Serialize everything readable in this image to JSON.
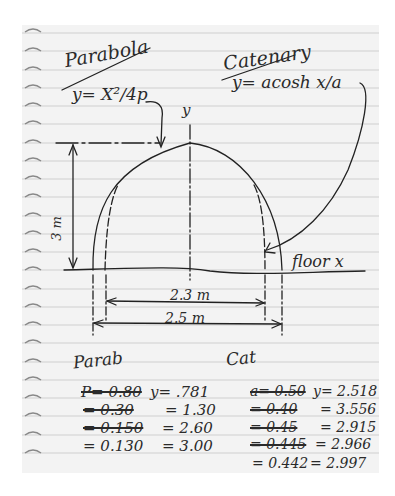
{
  "note": {
    "title_parabola": "Parabola",
    "eq_parabola": "y= X²/4p",
    "title_catenary": "Catenary",
    "eq_catenary": "y= acosh x/a",
    "axis_y": "y",
    "axis_floor": "floor x",
    "height_label": "3 m",
    "inner_width": "2.3 m",
    "outer_width": "2.5 m"
  },
  "parab": {
    "heading": "Parab",
    "rows": [
      {
        "p": "P= 0.80",
        "p_struck": true,
        "y": "y= .781"
      },
      {
        "p": "= 0.30",
        "p_struck": true,
        "y": "= 1.30"
      },
      {
        "p": "= 0.150",
        "p_struck": true,
        "y": "= 2.60"
      },
      {
        "p": "= 0.130",
        "p_struck": false,
        "y": "= 3.00"
      }
    ]
  },
  "cat": {
    "heading": "Cat",
    "rows": [
      {
        "a": "a= 0.50",
        "a_struck": true,
        "y": "y= 2.518"
      },
      {
        "a": "= 0.40",
        "a_struck": true,
        "y": "= 3.556"
      },
      {
        "a": "= 0.45",
        "a_struck": true,
        "y": "= 2.915"
      },
      {
        "a": "= 0.445",
        "a_struck": true,
        "y": "= 2.966"
      },
      {
        "a": "= 0.442",
        "a_struck": false,
        "y": "= 2.997"
      }
    ]
  }
}
